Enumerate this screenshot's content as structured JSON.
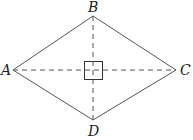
{
  "diagram": {
    "vertices": {
      "A": {
        "label": "A",
        "x": 13,
        "y": 70
      },
      "B": {
        "label": "B",
        "x": 93,
        "y": 16
      },
      "C": {
        "label": "C",
        "x": 176,
        "y": 70
      },
      "D": {
        "label": "D",
        "x": 93,
        "y": 120
      }
    },
    "edges": [
      "AB",
      "BC",
      "CD",
      "DA"
    ],
    "diagonals": [
      "AC",
      "BD"
    ],
    "right_angle_marker": "center square at intersection",
    "colors": {
      "stroke": "#555555",
      "text": "#222222"
    }
  }
}
